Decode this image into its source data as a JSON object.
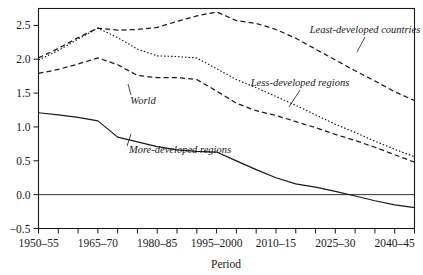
{
  "chart_data": {
    "type": "line",
    "title": "",
    "xlabel": "Period",
    "ylabel": "",
    "grid": false,
    "legend_position": "inline-annotations",
    "x": [
      "1950-55",
      "1955-60",
      "1960-65",
      "1965-70",
      "1970-75",
      "1975-80",
      "1980-85",
      "1985-90",
      "1990-95",
      "1995-2000",
      "2000-05",
      "2005-10",
      "2010-15",
      "2015-20",
      "2020-25",
      "2025-30",
      "2030-35",
      "2035-40",
      "2040-45",
      "2045-50"
    ],
    "tick_labels": [
      "1950–55",
      "1965–70",
      "1980–85",
      "1995–2000",
      "2010–15",
      "2025–30",
      "2040–45"
    ],
    "tick_label_indices": [
      0,
      3,
      6,
      9,
      12,
      15,
      18
    ],
    "ylim": [
      -0.5,
      2.75
    ],
    "xlim_index": [
      0,
      19
    ],
    "ytick_values": [
      -0.5,
      0.0,
      0.5,
      1.0,
      1.5,
      2.0,
      2.5
    ],
    "ytick_labels": [
      "−0.5",
      "0.0",
      "0.5",
      "1.0",
      "1.5",
      "2.0",
      "2.5"
    ],
    "series": [
      {
        "name": "Least-developed countries",
        "style": "dashed",
        "label": "Least-developed countries",
        "values": [
          2.02,
          2.16,
          2.32,
          2.46,
          2.43,
          2.44,
          2.47,
          2.56,
          2.64,
          2.7,
          2.57,
          2.53,
          2.44,
          2.31,
          2.15,
          1.99,
          1.83,
          1.68,
          1.52,
          1.39
        ]
      },
      {
        "name": "Less-developed regions",
        "style": "dotted",
        "label": "Less-developed regions",
        "values": [
          1.99,
          2.13,
          2.3,
          2.46,
          2.32,
          2.15,
          2.05,
          2.04,
          2.02,
          1.86,
          1.7,
          1.58,
          1.45,
          1.32,
          1.18,
          1.04,
          0.92,
          0.79,
          0.67,
          0.56
        ]
      },
      {
        "name": "World",
        "style": "dashed",
        "label": "World",
        "values": [
          1.79,
          1.85,
          1.93,
          2.02,
          1.92,
          1.76,
          1.73,
          1.73,
          1.7,
          1.53,
          1.35,
          1.24,
          1.17,
          1.08,
          0.99,
          0.89,
          0.8,
          0.7,
          0.59,
          0.48
        ]
      },
      {
        "name": "More-developed regions",
        "style": "solid",
        "label": "More-developed regions",
        "values": [
          1.21,
          1.18,
          1.14,
          1.09,
          0.85,
          0.78,
          0.71,
          0.66,
          0.64,
          0.63,
          0.5,
          0.37,
          0.25,
          0.16,
          0.11,
          0.05,
          -0.02,
          -0.09,
          -0.15,
          -0.19
        ]
      }
    ],
    "annotations": [
      {
        "text": "Least-developed countries",
        "x": 365,
        "y": 33
      },
      {
        "text": "Less-developed regions",
        "x": 300,
        "y": 86
      },
      {
        "text": "World",
        "x": 143,
        "y": 102
      },
      {
        "text": "More-developed regions",
        "x": 180,
        "y": 151
      }
    ],
    "colors": {
      "axis": "#1a1a1a",
      "line": "#1a1a1a",
      "background": "#ffffff"
    }
  }
}
